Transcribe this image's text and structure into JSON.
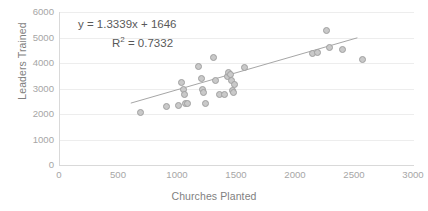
{
  "chart_data": {
    "type": "scatter",
    "title": "",
    "xlabel": "Churches Planted",
    "ylabel": "Leaders Trained",
    "xlim": [
      0,
      3000
    ],
    "ylim": [
      0,
      6000
    ],
    "xticks": [
      0,
      500,
      1000,
      1500,
      2000,
      2500,
      3000
    ],
    "yticks": [
      0,
      1000,
      2000,
      3000,
      4000,
      5000,
      6000
    ],
    "grid": "horizontal",
    "legend": "none",
    "marker_color": "#c9c9c9",
    "marker_edge_color": "#a0a0a0",
    "trendline_color": "#a6a6a6",
    "annotations": {
      "equation": "y = 1.3339x + 1646",
      "r_squared_prefix": "R",
      "r_squared_exp": "2",
      "r_squared_value": " = 0.7332"
    },
    "fit": {
      "slope": 1.3339,
      "intercept": 1646,
      "r2": 0.7332,
      "x_start": 600,
      "x_end": 2520
    },
    "points": [
      {
        "x": 680,
        "y": 2060
      },
      {
        "x": 905,
        "y": 2310
      },
      {
        "x": 1000,
        "y": 2350
      },
      {
        "x": 1030,
        "y": 3220
      },
      {
        "x": 1045,
        "y": 2980
      },
      {
        "x": 1055,
        "y": 2780
      },
      {
        "x": 1060,
        "y": 2400
      },
      {
        "x": 1080,
        "y": 2430
      },
      {
        "x": 1175,
        "y": 3880
      },
      {
        "x": 1195,
        "y": 3400
      },
      {
        "x": 1210,
        "y": 2960
      },
      {
        "x": 1215,
        "y": 2830
      },
      {
        "x": 1235,
        "y": 2420
      },
      {
        "x": 1300,
        "y": 4210
      },
      {
        "x": 1320,
        "y": 3330
      },
      {
        "x": 1355,
        "y": 2760
      },
      {
        "x": 1390,
        "y": 2770
      },
      {
        "x": 1420,
        "y": 3460
      },
      {
        "x": 1430,
        "y": 3620
      },
      {
        "x": 1445,
        "y": 3540
      },
      {
        "x": 1455,
        "y": 3300
      },
      {
        "x": 1465,
        "y": 2940
      },
      {
        "x": 1470,
        "y": 2850
      },
      {
        "x": 1480,
        "y": 3140
      },
      {
        "x": 1560,
        "y": 3830
      },
      {
        "x": 2140,
        "y": 4370
      },
      {
        "x": 2185,
        "y": 4400
      },
      {
        "x": 2260,
        "y": 5270
      },
      {
        "x": 2285,
        "y": 4620
      },
      {
        "x": 2390,
        "y": 4530
      },
      {
        "x": 2560,
        "y": 4130
      }
    ]
  }
}
